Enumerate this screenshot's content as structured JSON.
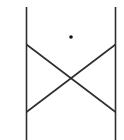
{
  "diagram": {
    "stroke_color": "#2e2e2e",
    "dot_color": "#111111",
    "background_color": "#ffffff",
    "elements": [
      {
        "name": "left-post",
        "type": "vertical-line"
      },
      {
        "name": "right-post",
        "type": "vertical-line"
      },
      {
        "name": "diagonal-brace-down",
        "type": "diagonal-line",
        "direction": "top-left to bottom-right"
      },
      {
        "name": "diagonal-brace-up",
        "type": "diagonal-line",
        "direction": "bottom-left to top-right"
      },
      {
        "name": "point-marker",
        "type": "dot",
        "position": "centered above crossing"
      }
    ]
  }
}
